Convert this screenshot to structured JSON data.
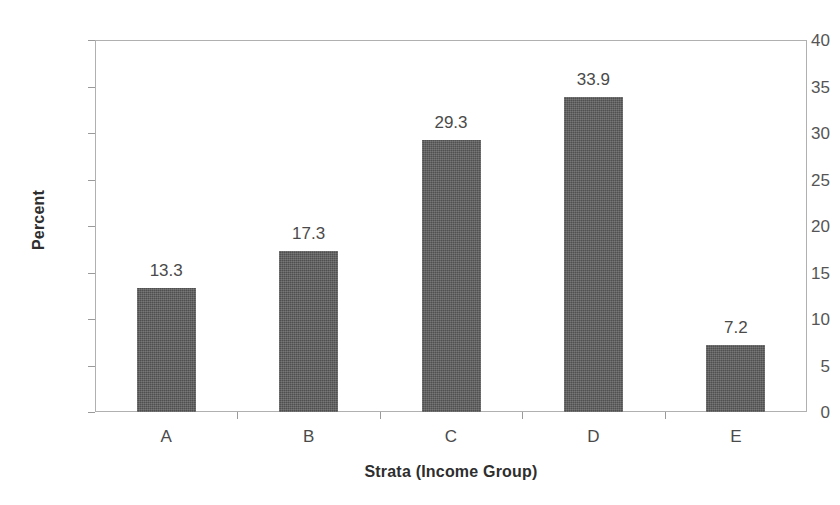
{
  "chart_data": {
    "type": "bar",
    "title": "",
    "subtitle": "",
    "xlabel": "Strata (Income Group)",
    "ylabel": "Percent",
    "categories": [
      "A",
      "B",
      "C",
      "D",
      "E"
    ],
    "values": [
      13.3,
      17.3,
      29.3,
      33.9,
      7.2
    ],
    "value_labels": [
      "13.3",
      "17.3",
      "29.3",
      "33.9",
      "7.2"
    ],
    "ylim": [
      0,
      40
    ],
    "ytick_step": 5,
    "ytick_labels": [
      "0",
      "5",
      "10",
      "15",
      "20",
      "25",
      "30",
      "35",
      "40"
    ],
    "ytick_values": [
      0,
      5,
      10,
      15,
      20,
      25,
      30,
      35,
      40
    ],
    "grid": false,
    "legend": false,
    "legend_position": "none",
    "bar_color": "#595959",
    "axis_color": "#b0b0b0",
    "label_color": "#4a4a4a",
    "title_color": "#2e2e2e",
    "background": "#ffffff"
  }
}
